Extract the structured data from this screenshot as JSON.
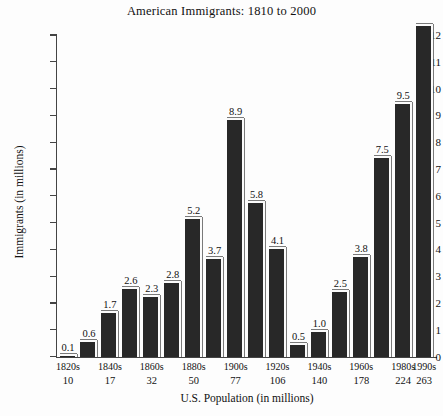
{
  "chart_data": {
    "type": "bar",
    "title": "American Immigrants: 1810 to 2000",
    "xlabel": "U.S. Population (in millions)",
    "ylabel": "Immigrants (in millions)",
    "ylim": [
      0,
      12
    ],
    "ytick_step": 1,
    "grid": false,
    "legend": "none",
    "categories": [
      "1820s",
      "1830s",
      "1840s",
      "1850s",
      "1860s",
      "1870s",
      "1880s",
      "1890s",
      "1900s",
      "1910s",
      "1920s",
      "1930s",
      "1940s",
      "1950s",
      "1960s",
      "1970s",
      "1980s",
      "1990s"
    ],
    "values": [
      0.1,
      0.6,
      1.7,
      2.6,
      2.3,
      2.8,
      5.2,
      3.7,
      8.9,
      5.8,
      4.1,
      0.5,
      1.0,
      2.5,
      3.8,
      7.5,
      9.5,
      12.4
    ],
    "value_labels": [
      "0.1",
      "0.6",
      "1.7",
      "2.6",
      "2.3",
      "2.8",
      "5.2",
      "3.7",
      "8.9",
      "5.8",
      "4.1",
      "0.5",
      "1.0",
      "2.5",
      "3.8",
      "7.5",
      "9.5",
      ""
    ],
    "ytick_labels": [
      "12",
      "11",
      "10",
      "9",
      "8",
      "7",
      "6",
      "5",
      "4",
      "3",
      "2",
      "1",
      "0"
    ],
    "ytick_values": [
      12,
      11,
      10,
      9,
      8,
      7,
      6,
      5,
      4,
      3,
      2,
      1,
      0
    ],
    "xtick_decade_labels": [
      "1820s",
      "",
      "1840s",
      "",
      "1860s",
      "",
      "1880s",
      "",
      "1900s",
      "",
      "1920s",
      "",
      "1940s",
      "",
      "1960s",
      "",
      "1980s",
      "1990s"
    ],
    "xtick_population_labels": [
      "10",
      "",
      "17",
      "",
      "32",
      "",
      "50",
      "",
      "77",
      "",
      "106",
      "",
      "140",
      "",
      "178",
      "",
      "224",
      "263"
    ],
    "bar_color": "#282828",
    "bar_highlight_color": "#fbfbfb",
    "axis_color": "#444444",
    "background_color": "#fdfdfd",
    "text_color": "#111111"
  }
}
